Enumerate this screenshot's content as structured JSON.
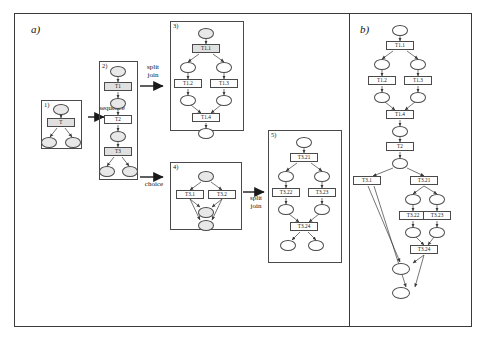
{
  "figure": {
    "panels": [
      {
        "id": "a",
        "label": "a)"
      },
      {
        "id": "b",
        "label": "b)"
      }
    ]
  },
  "panel_a": {
    "groups": [
      {
        "num": "1)"
      },
      {
        "num": "2)"
      },
      {
        "num": "3)"
      },
      {
        "num": "4)"
      },
      {
        "num": "5)"
      }
    ],
    "relations": [
      {
        "name": "sequence",
        "text": "sequence"
      },
      {
        "name": "split-join-1",
        "text": "split\njoin",
        "line1": "split",
        "line2": "join"
      },
      {
        "name": "choice",
        "text": "choice"
      },
      {
        "name": "split-join-2",
        "text": "split\njoin",
        "line1": "split",
        "line2": "join"
      }
    ],
    "group1": {
      "transitions": [
        {
          "label": "T"
        }
      ],
      "places": 3
    },
    "group2": {
      "transitions": [
        {
          "label": "T1"
        },
        {
          "label": "T2"
        },
        {
          "label": "T3"
        }
      ],
      "places": 5
    },
    "group3": {
      "transitions": [
        {
          "label": "T1.1"
        },
        {
          "label": "T1.2"
        },
        {
          "label": "T1.3"
        },
        {
          "label": "T1.4"
        }
      ],
      "places": 6
    },
    "group4": {
      "transitions": [
        {
          "label": "T3.1"
        },
        {
          "label": "T3.2"
        }
      ],
      "places": 3
    },
    "group5": {
      "transitions": [
        {
          "label": "T3.21"
        },
        {
          "label": "T3.22"
        },
        {
          "label": "T3.23"
        },
        {
          "label": "T3.24"
        }
      ],
      "places": 7
    }
  },
  "panel_b": {
    "transitions": [
      {
        "label": "T1.1"
      },
      {
        "label": "T1.2"
      },
      {
        "label": "T1.3"
      },
      {
        "label": "T1.4"
      },
      {
        "label": "T2"
      },
      {
        "label": "T3.1"
      },
      {
        "label": "T3.21"
      },
      {
        "label": "T3.22"
      },
      {
        "label": "T3.23"
      },
      {
        "label": "T3.24"
      }
    ]
  },
  "colors": {
    "place_fill": "#e8e8e8",
    "transition_fill": "#e0e0e0",
    "stroke": "#4a4a4a",
    "frame": "#3a3a3a",
    "background": "#ffffff"
  }
}
